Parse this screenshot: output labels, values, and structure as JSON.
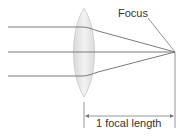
{
  "diagram": {
    "labels": {
      "focus": "Focus",
      "focal_length": "1 focal length"
    },
    "colors": {
      "ray": "#7a7a7a",
      "lens_fill": "#e6e6e6",
      "lens_stroke": "#c8c8c8",
      "text": "#333333",
      "background": "#ffffff"
    },
    "elements": {
      "rays": 3,
      "lens": "biconvex",
      "focal_point": "Focus"
    }
  }
}
